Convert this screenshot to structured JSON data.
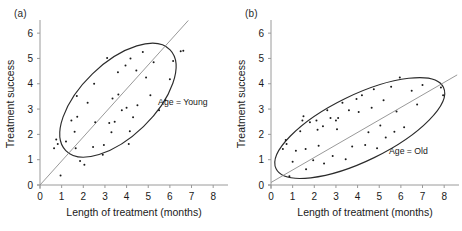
{
  "figure": {
    "background": "#ffffff",
    "point_color": "#1a1a1a",
    "line_color": "#8d8d8d",
    "ellipse_color": "#2b2b2b",
    "axis_color": "#9a9a9a"
  },
  "panels": [
    {
      "label": "(a)",
      "annotation": "Age = Young"
    },
    {
      "label": "(b)",
      "annotation": "Age = Old"
    }
  ],
  "chart_data": [
    {
      "type": "scatter",
      "title": "(a)",
      "xlabel": "Length of treatment (months)",
      "ylabel": "Treatment success",
      "xlim": [
        0,
        8.5
      ],
      "ylim": [
        0,
        6.4
      ],
      "xticks": [
        0,
        1,
        2,
        3,
        4,
        5,
        6,
        7,
        8
      ],
      "yticks": [
        0,
        1,
        2,
        3,
        4,
        5,
        6
      ],
      "grid": false,
      "annotations": [
        {
          "text": "Age = Young",
          "x": 6.6,
          "y": 3.15
        }
      ],
      "fit_line": {
        "x": [
          0,
          6.85
        ],
        "y": [
          0,
          6.5
        ],
        "intercept": 0,
        "slope": 0.95
      },
      "ellipse": {
        "cx": 3.6,
        "cy": 3.35,
        "rx": 3.35,
        "ry": 1.45,
        "angle_deg": -44
      },
      "points": [
        {
          "x": 0.65,
          "y": 1.45
        },
        {
          "x": 0.75,
          "y": 1.8
        },
        {
          "x": 0.82,
          "y": 1.62
        },
        {
          "x": 0.95,
          "y": 0.38
        },
        {
          "x": 1.2,
          "y": 1.72
        },
        {
          "x": 1.45,
          "y": 2.55
        },
        {
          "x": 1.6,
          "y": 2.1
        },
        {
          "x": 1.65,
          "y": 1.45
        },
        {
          "x": 1.7,
          "y": 3.52
        },
        {
          "x": 1.72,
          "y": 2.7
        },
        {
          "x": 1.85,
          "y": 0.95
        },
        {
          "x": 2.05,
          "y": 0.8
        },
        {
          "x": 2.2,
          "y": 3.25
        },
        {
          "x": 2.45,
          "y": 1.5
        },
        {
          "x": 2.5,
          "y": 4.0
        },
        {
          "x": 2.55,
          "y": 2.48
        },
        {
          "x": 2.9,
          "y": 1.2
        },
        {
          "x": 2.95,
          "y": 1.58
        },
        {
          "x": 3.1,
          "y": 5.02
        },
        {
          "x": 3.2,
          "y": 2.45
        },
        {
          "x": 3.3,
          "y": 2.08
        },
        {
          "x": 3.35,
          "y": 3.42
        },
        {
          "x": 3.45,
          "y": 2.5
        },
        {
          "x": 3.6,
          "y": 4.45
        },
        {
          "x": 3.62,
          "y": 3.58
        },
        {
          "x": 3.78,
          "y": 2.95
        },
        {
          "x": 3.95,
          "y": 4.72
        },
        {
          "x": 4.0,
          "y": 3.05
        },
        {
          "x": 4.1,
          "y": 1.62
        },
        {
          "x": 4.15,
          "y": 2.12
        },
        {
          "x": 4.18,
          "y": 5.0
        },
        {
          "x": 4.3,
          "y": 2.68
        },
        {
          "x": 4.45,
          "y": 4.52
        },
        {
          "x": 4.5,
          "y": 3.15
        },
        {
          "x": 4.75,
          "y": 5.25
        },
        {
          "x": 4.9,
          "y": 4.25
        },
        {
          "x": 5.1,
          "y": 3.55
        },
        {
          "x": 5.25,
          "y": 4.85
        },
        {
          "x": 5.5,
          "y": 2.95
        },
        {
          "x": 5.8,
          "y": 3.35
        },
        {
          "x": 6.0,
          "y": 4.18
        },
        {
          "x": 6.15,
          "y": 4.9
        },
        {
          "x": 6.5,
          "y": 5.28
        },
        {
          "x": 6.62,
          "y": 5.3
        }
      ]
    },
    {
      "type": "scatter",
      "title": "(b)",
      "xlabel": "Length of treatment (months)",
      "ylabel": "Treatment success",
      "xlim": [
        0,
        8.5
      ],
      "ylim": [
        0,
        6.4
      ],
      "xticks": [
        0,
        1,
        2,
        3,
        4,
        5,
        6,
        7,
        8
      ],
      "yticks": [
        0,
        1,
        2,
        3,
        4,
        5,
        6
      ],
      "grid": false,
      "annotations": [
        {
          "text": "Age = Old",
          "x": 6.35,
          "y": 1.22
        }
      ],
      "fit_line": {
        "x": [
          0,
          8.6
        ],
        "y": [
          0.1,
          4.35
        ],
        "intercept": 0.1,
        "slope": 0.494
      },
      "ellipse": {
        "cx": 4.1,
        "cy": 2.25,
        "rx": 4.3,
        "ry": 1.3,
        "angle_deg": -26
      },
      "points": [
        {
          "x": 0.55,
          "y": 1.42
        },
        {
          "x": 0.68,
          "y": 1.78
        },
        {
          "x": 0.72,
          "y": 1.62
        },
        {
          "x": 0.85,
          "y": 0.35
        },
        {
          "x": 1.0,
          "y": 0.92
        },
        {
          "x": 1.15,
          "y": 1.35
        },
        {
          "x": 1.35,
          "y": 2.12
        },
        {
          "x": 1.45,
          "y": 2.55
        },
        {
          "x": 1.5,
          "y": 2.72
        },
        {
          "x": 1.6,
          "y": 1.42
        },
        {
          "x": 1.62,
          "y": 0.62
        },
        {
          "x": 1.8,
          "y": 2.48
        },
        {
          "x": 1.95,
          "y": 0.98
        },
        {
          "x": 2.1,
          "y": 2.55
        },
        {
          "x": 2.15,
          "y": 2.18
        },
        {
          "x": 2.2,
          "y": 1.55
        },
        {
          "x": 2.4,
          "y": 2.32
        },
        {
          "x": 2.45,
          "y": 0.85
        },
        {
          "x": 2.6,
          "y": 2.95
        },
        {
          "x": 2.75,
          "y": 2.65
        },
        {
          "x": 2.85,
          "y": 1.15
        },
        {
          "x": 3.0,
          "y": 2.55
        },
        {
          "x": 3.05,
          "y": 2.2
        },
        {
          "x": 3.1,
          "y": 2.65
        },
        {
          "x": 3.3,
          "y": 3.25
        },
        {
          "x": 3.45,
          "y": 1.02
        },
        {
          "x": 3.6,
          "y": 2.95
        },
        {
          "x": 3.75,
          "y": 1.52
        },
        {
          "x": 3.95,
          "y": 3.4
        },
        {
          "x": 4.05,
          "y": 2.88
        },
        {
          "x": 4.2,
          "y": 3.55
        },
        {
          "x": 4.35,
          "y": 1.58
        },
        {
          "x": 4.5,
          "y": 2.08
        },
        {
          "x": 4.65,
          "y": 3.05
        },
        {
          "x": 4.75,
          "y": 3.78
        },
        {
          "x": 4.9,
          "y": 1.45
        },
        {
          "x": 5.05,
          "y": 2.35
        },
        {
          "x": 5.2,
          "y": 3.35
        },
        {
          "x": 5.3,
          "y": 1.88
        },
        {
          "x": 5.55,
          "y": 3.88
        },
        {
          "x": 5.7,
          "y": 2.1
        },
        {
          "x": 5.8,
          "y": 2.9
        },
        {
          "x": 5.95,
          "y": 4.25
        },
        {
          "x": 6.15,
          "y": 2.28
        },
        {
          "x": 6.5,
          "y": 3.72
        },
        {
          "x": 6.75,
          "y": 3.18
        },
        {
          "x": 7.0,
          "y": 3.95
        },
        {
          "x": 7.85,
          "y": 3.85
        },
        {
          "x": 7.95,
          "y": 3.55
        }
      ]
    }
  ]
}
